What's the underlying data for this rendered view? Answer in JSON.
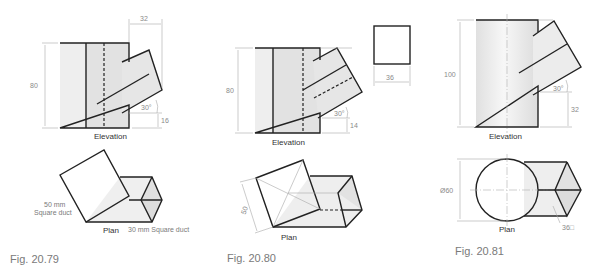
{
  "figures": [
    {
      "id": "fig-20-79",
      "caption": "Fig. 20.79",
      "elevation": {
        "label": "Elevation",
        "dims": {
          "height": "80",
          "offset": "32",
          "angle": "30°",
          "base": "16"
        }
      },
      "plan": {
        "label": "Plan",
        "notes": {
          "main_duct_line1": "50 mm",
          "main_duct_line2": "Square duct",
          "branch_duct": "30 mm Square duct"
        }
      }
    },
    {
      "id": "fig-20-80",
      "caption": "Fig. 20.80",
      "elevation": {
        "label": "Elevation",
        "dims": {
          "height": "80",
          "angle": "30°",
          "base": "14",
          "branch_section": "36"
        }
      },
      "plan": {
        "label": "Plan",
        "dims": {
          "side": "50"
        }
      }
    },
    {
      "id": "fig-20-81",
      "caption": "Fig. 20.81",
      "elevation": {
        "label": "Elevation",
        "dims": {
          "height": "100",
          "angle": "30°",
          "base": "32"
        }
      },
      "plan": {
        "label": "Plan",
        "dims": {
          "diameter": "Ø60",
          "branch_section": "36□"
        }
      }
    }
  ],
  "colors": {
    "fill_light": "#ededed",
    "fill_mid": "#dedede",
    "line": "#222222",
    "dim_line": "#a8a8a8"
  }
}
